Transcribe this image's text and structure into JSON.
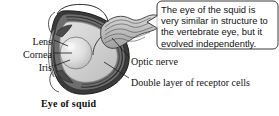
{
  "figure": {
    "caption": "Eye of squid",
    "background_color": "#ffffff",
    "ink_color": "#111111"
  },
  "callout": {
    "text": "The eye of the squid is very similar in structure to the vertebrate eye, but it evolved independently.",
    "border_color": "#3a3a3a",
    "fill_color": "#ffffff"
  },
  "labels": {
    "lens": "Lens",
    "cornea": "Cornea",
    "iris": "Iris",
    "optic_nerve": "Optic nerve",
    "receptor_cells": "Double layer of receptor cells"
  },
  "anatomy": {
    "lens_fill": "#d8d8d8",
    "vitreous_fill": "#cfcfcf",
    "retina_fill": "#6e6e6e",
    "wall_fill": "#3b3b3b",
    "nerve_fill": "#bdbdbd",
    "iris_fill": "#8a8a8a",
    "cornea_fill": "#e6e6e6"
  }
}
